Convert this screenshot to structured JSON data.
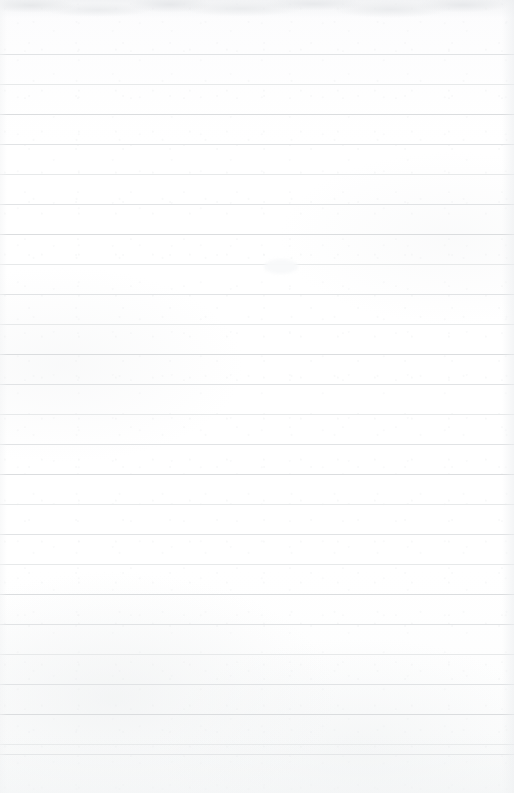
{
  "document": {
    "kind": "lined-notebook-page",
    "title": "Blank ruled notebook page",
    "written_text": "",
    "body_text": "",
    "page_number": "",
    "header_text": "",
    "footer_text": ""
  },
  "paper": {
    "width_px": 514,
    "height_px": 793,
    "background_color": "#fefefe",
    "base_tint_color": "#fcfcfd",
    "texture": "subtle paper grain with faint mottling, heavier toward the bottom and top edge"
  },
  "ruling": {
    "style": "wide-ruled horizontal lines, full bleed left to right",
    "line_color": "#e1e3e5",
    "line_thickness_px": 1,
    "spacing_px": 30,
    "first_line_y_px": 54,
    "last_line_y_px": 754,
    "line_count": 24,
    "margin_rule": "none",
    "line_y_positions": [
      54,
      84,
      114,
      144,
      174,
      204,
      234,
      264,
      294,
      324,
      354,
      384,
      414,
      444,
      474,
      504,
      534,
      564,
      594,
      624,
      654,
      684,
      714,
      744,
      754
    ]
  },
  "marks": {
    "description": "page is otherwise unwritten; a single faint break / erasure smudge interrupts one ruled line",
    "items": [
      {
        "name": "line-break-smudge",
        "type": "erasure-gap",
        "x_px": 270,
        "y_px": 266,
        "width_px": 20,
        "height_px": 4
      }
    ]
  },
  "edges": {
    "top_shadow": "mottled gray scan band, approx 18px tall",
    "right_shadow": "soft gray falloff, approx 12px wide",
    "left_shadow": "very faint gray falloff, approx 7px wide",
    "bottom_shadow": "soft gray tint rising approx 60px"
  }
}
